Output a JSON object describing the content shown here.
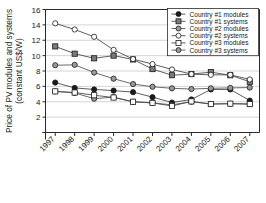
{
  "chart_data": {
    "type": "line",
    "title": "",
    "xlabel": "",
    "ylabel": "Price of PV modules and systems (constant US$/W)",
    "ylabel_line1": "Price of PV modules and systems",
    "ylabel_line2": "(constant US$/W)",
    "categories": [
      "1997",
      "1998",
      "1999",
      "2000",
      "2001",
      "2002",
      "2003",
      "2004",
      "2005",
      "2006",
      "2007"
    ],
    "xlim": [
      1997,
      2007
    ],
    "ylim": [
      0,
      16
    ],
    "yticks": [
      0,
      2,
      4,
      6,
      8,
      10,
      12,
      14,
      16
    ],
    "ytick_labels": [
      "",
      "2",
      "4",
      "6",
      "8",
      "10",
      "12",
      "14",
      "16"
    ],
    "grid": "horizontal",
    "legend_position": "top-right",
    "series": [
      {
        "name": "Country #1 modules",
        "marker": "filled-circle",
        "marker_fill": "#1a1a1a",
        "marker_stroke": "#1a1a1a",
        "line_color": "#4d4d4d",
        "values": [
          6.5,
          5.8,
          5.6,
          5.45,
          5.25,
          4.6,
          3.9,
          4.3,
          5.6,
          5.6,
          4.15
        ]
      },
      {
        "name": "Country #1 systems",
        "marker": "filled-square",
        "marker_fill": "#7a7a7a",
        "marker_stroke": "#1a1a1a",
        "line_color": "#4d4d4d",
        "values": [
          11.2,
          10.25,
          9.65,
          10.0,
          9.5,
          8.25,
          7.45,
          7.6,
          7.85,
          7.45,
          6.6
        ]
      },
      {
        "name": "Country #2 modules",
        "marker": "gray-circle",
        "marker_fill": "#9a9a9a",
        "marker_stroke": "#1a1a1a",
        "line_color": "#5a5a5a",
        "values": [
          5.35,
          5.15,
          4.4,
          4.6,
          4.0,
          3.85,
          3.6,
          4.0,
          3.7,
          3.75,
          3.7
        ]
      },
      {
        "name": "Country #2 systems",
        "marker": "open-circle",
        "marker_fill": "#ffffff",
        "marker_stroke": "#1a1a1a",
        "line_color": "#4d4d4d",
        "values": [
          14.2,
          13.4,
          12.45,
          10.75,
          9.55,
          8.9,
          8.2,
          7.6,
          7.5,
          7.5,
          6.9
        ]
      },
      {
        "name": "Country #3 modules",
        "marker": "open-square",
        "marker_fill": "#ffffff",
        "marker_stroke": "#1a1a1a",
        "line_color": "#4d4d4d",
        "values": [
          5.35,
          5.2,
          4.85,
          4.55,
          4.0,
          3.85,
          3.45,
          4.05,
          3.7,
          3.75,
          3.7
        ]
      },
      {
        "name": "Country #3 systems",
        "marker": "gray-circle",
        "marker_fill": "#9a9a9a",
        "marker_stroke": "#1a1a1a",
        "line_color": "#5a5a5a",
        "values": [
          8.75,
          8.8,
          7.8,
          7.0,
          6.3,
          5.95,
          5.75,
          5.65,
          5.75,
          5.8,
          5.85
        ]
      }
    ]
  },
  "legend": {
    "items": [
      {
        "label": "Country #1 modules"
      },
      {
        "label": "Country #1 systems"
      },
      {
        "label": "Country #2 modules"
      },
      {
        "label": "Country #2 systems"
      },
      {
        "label": "Country #3 modules"
      },
      {
        "label": "Country #3 systems"
      }
    ]
  },
  "colors": {
    "axis": "#2b2b2b",
    "grid": "#c9c9c9",
    "background": "#ffffff",
    "marker_dark": "#1a1a1a",
    "marker_gray": "#9a9a9a",
    "marker_square_gray": "#7a7a7a",
    "marker_open": "#ffffff"
  }
}
